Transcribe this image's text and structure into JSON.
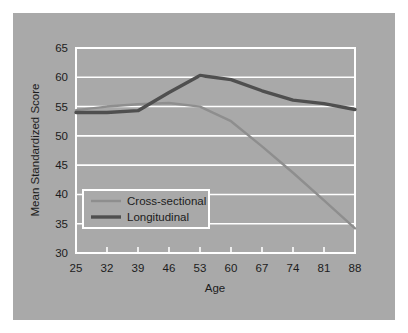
{
  "chart_data": {
    "type": "line",
    "title": "",
    "xlabel": "Age",
    "ylabel": "Mean Standardized Score",
    "x": [
      25,
      32,
      39,
      46,
      53,
      60,
      67,
      74,
      81,
      88
    ],
    "xtick_labels": [
      "25",
      "32",
      "39",
      "46",
      "53",
      "60",
      "67",
      "74",
      "81",
      "88"
    ],
    "ytick_labels": [
      "30",
      "35",
      "40",
      "45",
      "50",
      "55",
      "60",
      "65"
    ],
    "yticks": [
      30,
      35,
      40,
      45,
      50,
      55,
      60,
      65
    ],
    "xlim": [
      25,
      88
    ],
    "ylim": [
      30,
      65
    ],
    "grid": true,
    "legend_position": "lower-left-inside",
    "series": [
      {
        "name": "Cross-sectional",
        "color": "#8e8e8e",
        "values": [
          54.4,
          55.0,
          55.4,
          55.6,
          55.0,
          52.5,
          48.2,
          43.7,
          39.0,
          34.2
        ]
      },
      {
        "name": "Longitudinal",
        "color": "#4f4f4f",
        "values": [
          54.0,
          54.0,
          54.3,
          57.4,
          60.3,
          59.6,
          57.7,
          56.1,
          55.5,
          54.5
        ]
      }
    ]
  },
  "legend": {
    "entries": [
      {
        "label": "Cross-sectional"
      },
      {
        "label": "Longitudinal"
      }
    ]
  },
  "colors": {
    "panel_background": "#a9a9a9",
    "page_background": "#ffffff",
    "gridline": "#ffffff",
    "text": "#1c1c1c",
    "cross_sectional": "#8e8e8e",
    "longitudinal": "#4f4f4f"
  }
}
